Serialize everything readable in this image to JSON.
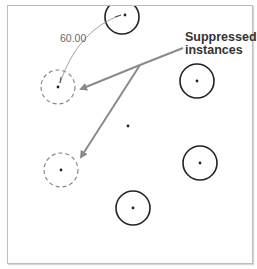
{
  "diagram": {
    "callout": {
      "line1": "Suppressed",
      "line2": "instances"
    },
    "dimension": {
      "value": "60.00"
    },
    "colors": {
      "solid_circle": "#222222",
      "dashed_circle": "#888888",
      "arrow": "#8a8a8a",
      "frame": "#bdbdbd",
      "text": "#333333"
    },
    "instances": [
      {
        "type": "solid",
        "cx": 122,
        "cy": 17
      },
      {
        "type": "solid",
        "cx": 197,
        "cy": 81
      },
      {
        "type": "solid",
        "cx": 200,
        "cy": 163
      },
      {
        "type": "solid",
        "cx": 133,
        "cy": 208
      },
      {
        "type": "suppressed",
        "cx": 58,
        "cy": 87
      },
      {
        "type": "suppressed",
        "cx": 61,
        "cy": 170
      }
    ],
    "center_point": {
      "cx": 128,
      "cy": 126
    }
  }
}
